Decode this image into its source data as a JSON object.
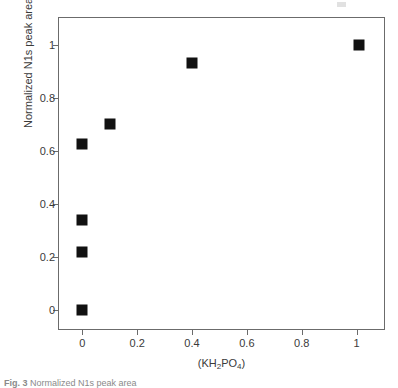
{
  "chart_data": {
    "type": "scatter",
    "title": "",
    "xlabel": "(KH2PO4)",
    "xlabel_parts": {
      "pre": "(KH",
      "sub1": "2",
      "mid": "PO",
      "sub2": "4",
      "post": ")"
    },
    "ylabel": "Normalized N1s peak area",
    "xlim": [
      -0.085,
      1.1
    ],
    "ylim": [
      -0.07,
      1.1
    ],
    "xticks": [
      0,
      0.2,
      0.4,
      0.6,
      0.8,
      1
    ],
    "xticklabels": [
      "0",
      "0.2",
      "0.4",
      "0.6",
      "0.8",
      "1"
    ],
    "yticks": [
      0,
      0.2,
      0.4,
      0.6,
      0.8,
      1
    ],
    "yticklabels": [
      "0",
      "0.2",
      "0.4",
      "0.6",
      "0.8",
      "1"
    ],
    "grid": false,
    "legend": null,
    "marker": "filled-square",
    "marker_color": "#111111",
    "frame_color": "#6b6b6b",
    "background": "#ffffff",
    "series": [
      {
        "name": "Normalized N1s peak area",
        "points": [
          {
            "x": 0.0,
            "y": 0.0
          },
          {
            "x": 0.0,
            "y": 0.22
          },
          {
            "x": 0.0,
            "y": 0.34
          },
          {
            "x": 0.0,
            "y": 0.625
          },
          {
            "x": 0.1,
            "y": 0.7
          },
          {
            "x": 0.4,
            "y": 0.93
          },
          {
            "x": 1.01,
            "y": 1.0
          }
        ]
      }
    ]
  },
  "caption": {
    "label": "Fig. 3",
    "text": "Normalized N1s peak area"
  }
}
